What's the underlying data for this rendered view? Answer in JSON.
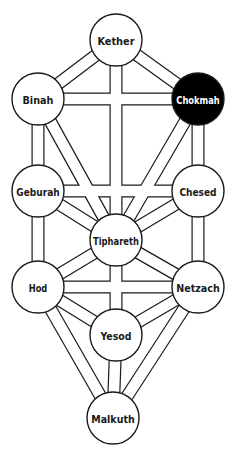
{
  "diagram": {
    "title": "",
    "colors": {
      "background": "#ffffff",
      "stroke": "#1a1a1a",
      "node_fill": "#ffffff",
      "highlight_fill": "#000000",
      "text": "#1a1a1a",
      "highlight_text": "#ffffff"
    },
    "node_radius": 26,
    "nodes": [
      {
        "id": "kether",
        "label": "Kether",
        "x": 116,
        "y": 40,
        "highlighted": false
      },
      {
        "id": "binah",
        "label": "Binah",
        "x": 38,
        "y": 99,
        "highlighted": false
      },
      {
        "id": "chokmah",
        "label": "Chokmah",
        "x": 198,
        "y": 99,
        "highlighted": true
      },
      {
        "id": "geburah",
        "label": "Geburah",
        "x": 38,
        "y": 191,
        "highlighted": false
      },
      {
        "id": "chesed",
        "label": "Chesed",
        "x": 198,
        "y": 191,
        "highlighted": false
      },
      {
        "id": "tiphareth",
        "label": "Tiphareth",
        "x": 116,
        "y": 240,
        "highlighted": false
      },
      {
        "id": "hod",
        "label": "Hod",
        "x": 38,
        "y": 287,
        "highlighted": false
      },
      {
        "id": "netzach",
        "label": "Netzach",
        "x": 198,
        "y": 287,
        "highlighted": false
      },
      {
        "id": "yesod",
        "label": "Yesod",
        "x": 116,
        "y": 335,
        "highlighted": false
      },
      {
        "id": "malkuth",
        "label": "Malkuth",
        "x": 113,
        "y": 418,
        "highlighted": false
      }
    ],
    "edges": [
      [
        "kether",
        "binah"
      ],
      [
        "kether",
        "chokmah"
      ],
      [
        "kether",
        "tiphareth"
      ],
      [
        "binah",
        "chokmah"
      ],
      [
        "binah",
        "geburah"
      ],
      [
        "binah",
        "tiphareth"
      ],
      [
        "chokmah",
        "chesed"
      ],
      [
        "chokmah",
        "tiphareth"
      ],
      [
        "geburah",
        "chesed"
      ],
      [
        "geburah",
        "tiphareth"
      ],
      [
        "geburah",
        "hod"
      ],
      [
        "chesed",
        "tiphareth"
      ],
      [
        "chesed",
        "netzach"
      ],
      [
        "tiphareth",
        "hod"
      ],
      [
        "tiphareth",
        "netzach"
      ],
      [
        "tiphareth",
        "yesod"
      ],
      [
        "hod",
        "netzach"
      ],
      [
        "hod",
        "yesod"
      ],
      [
        "hod",
        "malkuth"
      ],
      [
        "netzach",
        "yesod"
      ],
      [
        "netzach",
        "malkuth"
      ],
      [
        "yesod",
        "malkuth"
      ]
    ]
  }
}
